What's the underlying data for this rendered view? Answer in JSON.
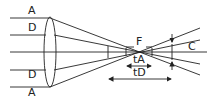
{
  "diagram": {
    "labels": {
      "a_top": "A",
      "d_top": "D",
      "d_bottom": "D",
      "a_bottom": "A",
      "focus": "F",
      "circle_of_confusion": "C",
      "depth_a": "tA",
      "depth_d": "tD"
    },
    "colors": {
      "stroke": "#222222",
      "background": "#ffffff"
    }
  }
}
